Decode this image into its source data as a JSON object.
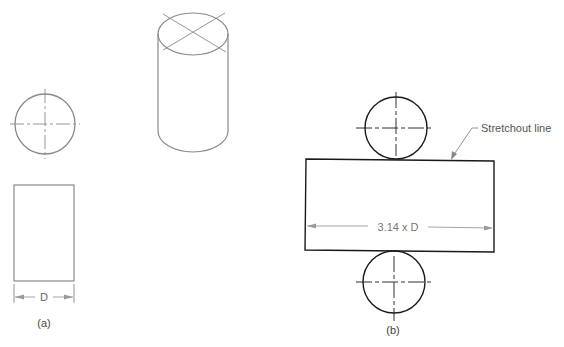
{
  "figure": {
    "part_a": {
      "caption": "(a)",
      "dimension_label": "D"
    },
    "part_b": {
      "caption": "(b)",
      "dimension_label": "3.14 x D",
      "callout_label": "Stretchout line"
    },
    "colors": {
      "part_a_stroke": "#8a8a8a",
      "part_b_stroke": "#1a1a1a",
      "dimension_stroke": "#9a9a9a",
      "text": "#555555"
    }
  }
}
